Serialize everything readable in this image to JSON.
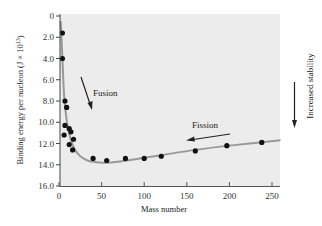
{
  "chart_data": {
    "type": "scatter",
    "title": "",
    "xlabel": "Mass number",
    "ylabel": "Binding energy per nucleon (J × 10^13)",
    "ylabel_parts": {
      "main": "Binding energy per nucleon (J × 10",
      "sup": "13",
      "end": ")"
    },
    "xlim": [
      0,
      260
    ],
    "ylim": [
      0,
      16.0
    ],
    "y_inverted": true,
    "xticks": [
      0,
      50,
      100,
      150,
      200,
      250
    ],
    "yticks": [
      "0",
      "2.0",
      "4.0",
      "6.0",
      "8.0",
      "10.0",
      "12.0",
      "14.0",
      "16.0"
    ],
    "grid": false,
    "points": [
      {
        "x": 4,
        "y": 1.6
      },
      {
        "x": 4,
        "y": 4.0
      },
      {
        "x": 7,
        "y": 8.0
      },
      {
        "x": 9,
        "y": 8.6
      },
      {
        "x": 7,
        "y": 10.3
      },
      {
        "x": 12,
        "y": 10.6
      },
      {
        "x": 6,
        "y": 11.2
      },
      {
        "x": 14,
        "y": 10.9
      },
      {
        "x": 17,
        "y": 11.6
      },
      {
        "x": 12,
        "y": 12.1
      },
      {
        "x": 16,
        "y": 12.6
      },
      {
        "x": 40,
        "y": 13.4
      },
      {
        "x": 56,
        "y": 13.6
      },
      {
        "x": 78,
        "y": 13.4
      },
      {
        "x": 100,
        "y": 13.4
      },
      {
        "x": 120,
        "y": 13.2
      },
      {
        "x": 160,
        "y": 12.7
      },
      {
        "x": 197,
        "y": 12.2
      },
      {
        "x": 238,
        "y": 11.9
      }
    ],
    "curve": [
      {
        "x": 2,
        "y": 0.5
      },
      {
        "x": 4,
        "y": 4
      },
      {
        "x": 6,
        "y": 7.5
      },
      {
        "x": 9,
        "y": 9.8
      },
      {
        "x": 13,
        "y": 11.4
      },
      {
        "x": 18,
        "y": 12.5
      },
      {
        "x": 25,
        "y": 13.2
      },
      {
        "x": 35,
        "y": 13.65
      },
      {
        "x": 50,
        "y": 13.8
      },
      {
        "x": 60,
        "y": 13.8
      },
      {
        "x": 80,
        "y": 13.6
      },
      {
        "x": 120,
        "y": 13.1
      },
      {
        "x": 160,
        "y": 12.6
      },
      {
        "x": 200,
        "y": 12.2
      },
      {
        "x": 260,
        "y": 11.7
      }
    ],
    "annotations": [
      {
        "text": "Fusion",
        "arrow_direction": "down"
      },
      {
        "text": "Fission",
        "arrow_direction": "left"
      },
      {
        "text": "Increased stability",
        "arrow_direction": "down"
      }
    ],
    "colors": {
      "plot_bg": "#eeeeee",
      "curve": "#999999",
      "points": "#111111"
    }
  }
}
